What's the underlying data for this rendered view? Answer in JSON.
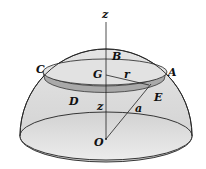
{
  "diagram": {
    "labels": {
      "z_axis": "z",
      "B": "B",
      "C": "C",
      "G": "G",
      "r": "r",
      "A": "A",
      "E": "E",
      "D": "D",
      "z_height": "z",
      "a": "a",
      "O": "O"
    },
    "colors": {
      "dome_fill": "#dcdcdc",
      "ring_fill": "#a9a9a9",
      "inner_fill": "#e6e6e6",
      "stroke": "#222222"
    }
  }
}
